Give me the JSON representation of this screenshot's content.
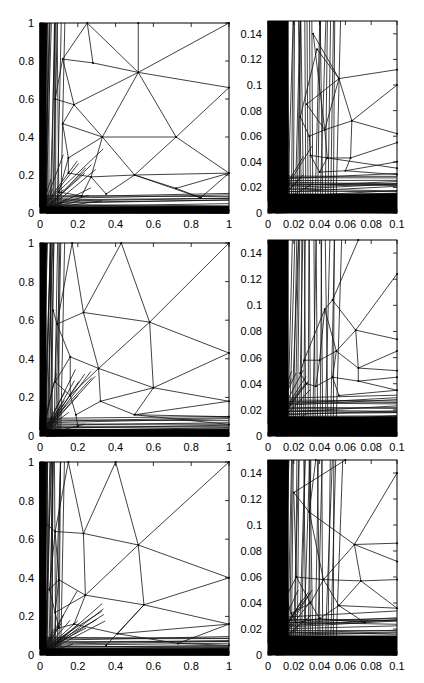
{
  "chart_data": [
    {
      "type": "mesh",
      "row": 1,
      "col": 1,
      "xlim": [
        0,
        1
      ],
      "ylim": [
        0,
        1
      ],
      "xticks": [
        "0",
        "0.2",
        "0.4",
        "0.6",
        "0.8",
        "1"
      ],
      "yticks": [
        "0",
        "0.2",
        "0.4",
        "0.6",
        "0.8",
        "1"
      ],
      "box": {
        "x": 40,
        "y": 23,
        "w": 189,
        "h": 190
      },
      "nodes": [
        [
          0.52,
          0.74
        ],
        [
          0.72,
          0.4
        ],
        [
          0.33,
          0.4
        ],
        [
          0.18,
          0.57
        ],
        [
          0.12,
          0.81
        ],
        [
          0.25,
          1
        ],
        [
          0.52,
          1
        ],
        [
          1,
          1
        ],
        [
          1,
          0.66
        ],
        [
          1,
          0.21
        ],
        [
          0.27,
          0.19
        ],
        [
          0.15,
          0.29
        ],
        [
          0.5,
          0.2
        ],
        [
          0.72,
          0.13
        ],
        [
          0.85,
          0.08
        ],
        [
          0.35,
          0.1
        ],
        [
          0.22,
          0.09
        ],
        [
          0.1,
          0.11
        ],
        [
          0.12,
          0.47
        ],
        [
          0.08,
          0.6
        ],
        [
          0.15,
          0.21
        ],
        [
          0.28,
          0.79
        ]
      ],
      "edges": [
        [
          0,
          5
        ],
        [
          0,
          6
        ],
        [
          0,
          7
        ],
        [
          0,
          8
        ],
        [
          0,
          2
        ],
        [
          0,
          1
        ],
        [
          0,
          3
        ],
        [
          0,
          21
        ],
        [
          21,
          5
        ],
        [
          21,
          4
        ],
        [
          4,
          3
        ],
        [
          3,
          2
        ],
        [
          2,
          1
        ],
        [
          1,
          8
        ],
        [
          1,
          9
        ],
        [
          1,
          12
        ],
        [
          2,
          12
        ],
        [
          2,
          10
        ],
        [
          2,
          11
        ],
        [
          2,
          18
        ],
        [
          3,
          18
        ],
        [
          3,
          19
        ],
        [
          12,
          9
        ],
        [
          12,
          13
        ],
        [
          13,
          9
        ],
        [
          13,
          14
        ],
        [
          14,
          9
        ],
        [
          10,
          12
        ],
        [
          10,
          15
        ],
        [
          10,
          16
        ],
        [
          15,
          12
        ],
        [
          16,
          17
        ],
        [
          11,
          20
        ],
        [
          20,
          10
        ],
        [
          11,
          17
        ],
        [
          19,
          4
        ],
        [
          4,
          5
        ],
        [
          18,
          11
        ],
        [
          12,
          14
        ]
      ]
    },
    {
      "type": "mesh",
      "row": 1,
      "col": 2,
      "xlim": [
        0,
        0.1
      ],
      "ylim": [
        0,
        0.15
      ],
      "xticks": [
        "0",
        "0.02",
        "0.04",
        "0.06",
        "0.08",
        "0.1"
      ],
      "yticks": [
        "0",
        "0.02",
        "0.04",
        "0.06",
        "0.08",
        "0.1",
        "0.12",
        "0.14"
      ],
      "box": {
        "x": 268,
        "y": 21,
        "w": 129,
        "h": 192
      },
      "nodes": [
        [
          0.055,
          0.105
        ],
        [
          0.065,
          0.072
        ],
        [
          0.044,
          0.065
        ],
        [
          0.046,
          0.043
        ],
        [
          0.064,
          0.043
        ],
        [
          0.06,
          0.033
        ],
        [
          0.035,
          0.14
        ],
        [
          0.038,
          0.128
        ],
        [
          0.1,
          0.112
        ],
        [
          0.1,
          0.1
        ],
        [
          0.1,
          0.062
        ],
        [
          0.1,
          0.055
        ],
        [
          0.1,
          0.04
        ],
        [
          0.1,
          0.035
        ],
        [
          0.1,
          0.03
        ],
        [
          0.03,
          0.085
        ],
        [
          0.032,
          0.06
        ],
        [
          0.033,
          0.045
        ],
        [
          0.04,
          0.032
        ],
        [
          0.025,
          0.075
        ]
      ],
      "edges": [
        [
          0,
          6
        ],
        [
          0,
          7
        ],
        [
          0,
          8
        ],
        [
          0,
          2
        ],
        [
          0,
          1
        ],
        [
          0,
          15
        ],
        [
          1,
          9
        ],
        [
          1,
          10
        ],
        [
          1,
          2
        ],
        [
          1,
          4
        ],
        [
          2,
          3
        ],
        [
          2,
          16
        ],
        [
          2,
          15
        ],
        [
          3,
          4
        ],
        [
          3,
          17
        ],
        [
          3,
          18
        ],
        [
          4,
          11
        ],
        [
          4,
          5
        ],
        [
          5,
          12
        ],
        [
          5,
          18
        ],
        [
          3,
          13
        ],
        [
          5,
          14
        ],
        [
          6,
          2
        ],
        [
          7,
          19
        ],
        [
          19,
          16
        ],
        [
          16,
          17
        ],
        [
          17,
          18
        ]
      ]
    },
    {
      "type": "mesh",
      "row": 2,
      "col": 1,
      "xlim": [
        0,
        1
      ],
      "ylim": [
        0,
        1
      ],
      "xticks": [
        "0",
        "0.2",
        "0.4",
        "0.6",
        "0.8",
        "1"
      ],
      "yticks": [
        "0",
        "0.2",
        "0.4",
        "0.6",
        "0.8",
        "1"
      ],
      "box": {
        "x": 40,
        "y": 243,
        "w": 189,
        "h": 193
      },
      "nodes": [
        [
          0.58,
          0.59
        ],
        [
          0.23,
          0.64
        ],
        [
          0.09,
          0.58
        ],
        [
          0.31,
          0.35
        ],
        [
          0.16,
          0.41
        ],
        [
          0.6,
          0.25
        ],
        [
          0.16,
          0.21
        ],
        [
          0.32,
          0.18
        ],
        [
          0.5,
          0.11
        ],
        [
          0.19,
          0.11
        ],
        [
          0.43,
          1
        ],
        [
          0.17,
          1
        ],
        [
          1,
          1
        ],
        [
          1,
          0.43
        ],
        [
          1,
          0.18
        ],
        [
          0.08,
          0.28
        ],
        [
          0.07,
          0.65
        ],
        [
          0.2,
          0.05
        ],
        [
          1,
          0.1
        ],
        [
          1,
          0.06
        ]
      ],
      "edges": [
        [
          0,
          10
        ],
        [
          0,
          12
        ],
        [
          0,
          13
        ],
        [
          0,
          1
        ],
        [
          0,
          3
        ],
        [
          0,
          5
        ],
        [
          1,
          10
        ],
        [
          1,
          11
        ],
        [
          1,
          2
        ],
        [
          1,
          3
        ],
        [
          2,
          16
        ],
        [
          2,
          4
        ],
        [
          3,
          4
        ],
        [
          3,
          5
        ],
        [
          3,
          7
        ],
        [
          3,
          6
        ],
        [
          4,
          6
        ],
        [
          4,
          15
        ],
        [
          5,
          13
        ],
        [
          5,
          14
        ],
        [
          5,
          7
        ],
        [
          5,
          8
        ],
        [
          7,
          8
        ],
        [
          7,
          9
        ],
        [
          6,
          9
        ],
        [
          6,
          15
        ],
        [
          8,
          14
        ],
        [
          8,
          18
        ],
        [
          9,
          17
        ],
        [
          8,
          19
        ],
        [
          11,
          2
        ],
        [
          2,
          15
        ]
      ]
    },
    {
      "type": "mesh",
      "row": 2,
      "col": 2,
      "xlim": [
        0,
        0.1
      ],
      "ylim": [
        0,
        0.15
      ],
      "xticks": [
        "0",
        "0.02",
        "0.04",
        "0.06",
        "0.08",
        "0.1"
      ],
      "yticks": [
        "0",
        "0.02",
        "0.04",
        "0.06",
        "0.08",
        "0.1",
        "0.12",
        "0.14"
      ],
      "box": {
        "x": 268,
        "y": 240,
        "w": 129,
        "h": 196
      },
      "nodes": [
        [
          0.05,
          0.104
        ],
        [
          0.044,
          0.097
        ],
        [
          0.068,
          0.081
        ],
        [
          0.053,
          0.065
        ],
        [
          0.07,
          0.052
        ],
        [
          0.05,
          0.045
        ],
        [
          0.028,
          0.058
        ],
        [
          0.04,
          0.058
        ],
        [
          0.07,
          0.042
        ],
        [
          0.037,
          0.038
        ],
        [
          0.1,
          0.124
        ],
        [
          0.1,
          0.074
        ],
        [
          0.1,
          0.065
        ],
        [
          0.1,
          0.05
        ],
        [
          0.1,
          0.045
        ],
        [
          0.1,
          0.035
        ],
        [
          0.07,
          0.15
        ],
        [
          0.025,
          0.048
        ],
        [
          0.03,
          0.04
        ],
        [
          0.055,
          0.031
        ]
      ],
      "edges": [
        [
          0,
          1
        ],
        [
          0,
          2
        ],
        [
          0,
          16
        ],
        [
          1,
          3
        ],
        [
          1,
          6
        ],
        [
          2,
          10
        ],
        [
          2,
          11
        ],
        [
          2,
          3
        ],
        [
          2,
          4
        ],
        [
          3,
          4
        ],
        [
          3,
          5
        ],
        [
          3,
          7
        ],
        [
          4,
          12
        ],
        [
          4,
          13
        ],
        [
          4,
          8
        ],
        [
          5,
          8
        ],
        [
          5,
          9
        ],
        [
          5,
          19
        ],
        [
          7,
          6
        ],
        [
          7,
          9
        ],
        [
          6,
          17
        ],
        [
          17,
          18
        ],
        [
          18,
          9
        ],
        [
          8,
          14
        ],
        [
          8,
          15
        ],
        [
          19,
          15
        ],
        [
          1,
          7
        ]
      ]
    },
    {
      "type": "mesh",
      "row": 3,
      "col": 1,
      "xlim": [
        0,
        1
      ],
      "ylim": [
        0,
        1
      ],
      "xticks": [
        "0",
        "0.2",
        "0.4",
        "0.6",
        "0.8",
        "1"
      ],
      "yticks": [
        "0",
        "0.2",
        "0.4",
        "0.6",
        "0.8",
        "1"
      ],
      "box": {
        "x": 40,
        "y": 462,
        "w": 189,
        "h": 193
      },
      "nodes": [
        [
          0.52,
          0.57
        ],
        [
          0.23,
          0.63
        ],
        [
          0.08,
          0.64
        ],
        [
          0.24,
          0.31
        ],
        [
          0.1,
          0.39
        ],
        [
          0.55,
          0.26
        ],
        [
          0.08,
          0.22
        ],
        [
          0.18,
          0.16
        ],
        [
          0.41,
          0.11
        ],
        [
          0.05,
          0.34
        ],
        [
          0.4,
          1
        ],
        [
          0.15,
          1
        ],
        [
          1,
          1
        ],
        [
          1,
          0.4
        ],
        [
          1,
          0.16
        ],
        [
          0.02,
          0.69
        ],
        [
          0.73,
          0.06
        ],
        [
          0.35,
          0.05
        ],
        [
          0.1,
          0.14
        ],
        [
          1,
          0.05
        ]
      ],
      "edges": [
        [
          0,
          10
        ],
        [
          0,
          12
        ],
        [
          0,
          13
        ],
        [
          0,
          1
        ],
        [
          0,
          3
        ],
        [
          0,
          5
        ],
        [
          1,
          10
        ],
        [
          1,
          11
        ],
        [
          1,
          2
        ],
        [
          1,
          3
        ],
        [
          2,
          15
        ],
        [
          2,
          4
        ],
        [
          2,
          9
        ],
        [
          3,
          4
        ],
        [
          3,
          5
        ],
        [
          3,
          7
        ],
        [
          3,
          6
        ],
        [
          4,
          9
        ],
        [
          4,
          6
        ],
        [
          5,
          13
        ],
        [
          5,
          14
        ],
        [
          5,
          8
        ],
        [
          5,
          17
        ],
        [
          7,
          8
        ],
        [
          7,
          18
        ],
        [
          6,
          18
        ],
        [
          8,
          14
        ],
        [
          16,
          14
        ],
        [
          16,
          19
        ],
        [
          8,
          16
        ],
        [
          11,
          2
        ],
        [
          6,
          9
        ]
      ]
    },
    {
      "type": "mesh",
      "row": 3,
      "col": 2,
      "xlim": [
        0,
        0.1
      ],
      "ylim": [
        0,
        0.15
      ],
      "xticks": [
        "0",
        "0.02",
        "0.04",
        "0.06",
        "0.08",
        "0.1"
      ],
      "yticks": [
        "0",
        "0.02",
        "0.04",
        "0.06",
        "0.08",
        "0.1",
        "0.12",
        "0.14"
      ],
      "box": {
        "x": 268,
        "y": 460,
        "w": 129,
        "h": 195
      },
      "nodes": [
        [
          0.02,
          0.125
        ],
        [
          0.032,
          0.11
        ],
        [
          0.067,
          0.085
        ],
        [
          0.043,
          0.058
        ],
        [
          0.022,
          0.06
        ],
        [
          0.072,
          0.057
        ],
        [
          0.055,
          0.038
        ],
        [
          0.033,
          0.04
        ],
        [
          0.04,
          0.028
        ],
        [
          0.022,
          0.025
        ],
        [
          0.1,
          0.14
        ],
        [
          0.1,
          0.086
        ],
        [
          0.1,
          0.072
        ],
        [
          0.1,
          0.058
        ],
        [
          0.1,
          0.036
        ],
        [
          0.075,
          0.025
        ],
        [
          0.014,
          0.045
        ],
        [
          0.06,
          0.15
        ],
        [
          0.037,
          0.15
        ],
        [
          0.018,
          0.032
        ]
      ],
      "edges": [
        [
          0,
          1
        ],
        [
          0,
          17
        ],
        [
          0,
          4
        ],
        [
          1,
          2
        ],
        [
          1,
          3
        ],
        [
          1,
          18
        ],
        [
          2,
          10
        ],
        [
          2,
          11
        ],
        [
          2,
          12
        ],
        [
          2,
          3
        ],
        [
          2,
          5
        ],
        [
          3,
          4
        ],
        [
          3,
          5
        ],
        [
          3,
          6
        ],
        [
          3,
          7
        ],
        [
          4,
          7
        ],
        [
          4,
          16
        ],
        [
          5,
          13
        ],
        [
          5,
          14
        ],
        [
          5,
          6
        ],
        [
          6,
          14
        ],
        [
          6,
          8
        ],
        [
          6,
          15
        ],
        [
          7,
          8
        ],
        [
          8,
          9
        ],
        [
          9,
          19
        ],
        [
          19,
          7
        ],
        [
          16,
          19
        ],
        [
          8,
          15
        ]
      ]
    }
  ]
}
